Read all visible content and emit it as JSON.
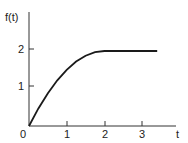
{
  "chart_data": {
    "type": "line",
    "title": "",
    "xlabel": "t",
    "ylabel": "f(t)",
    "x_ticks": [
      "0",
      "1",
      "2",
      "3"
    ],
    "y_ticks": [
      "1",
      "2"
    ],
    "xlim": [
      0,
      4
    ],
    "ylim": [
      0,
      2.5
    ],
    "grid": false,
    "legend": null,
    "series": [
      {
        "name": "f(t)",
        "description": "Rises as t(4-t)/2 from 0 to 2 on [0,2], then constant at 2",
        "x": [
          0,
          0.25,
          0.5,
          0.75,
          1.0,
          1.25,
          1.5,
          1.75,
          2.0,
          2.5,
          3.0,
          3.4
        ],
        "y": [
          0,
          0.47,
          0.875,
          1.22,
          1.5,
          1.72,
          1.875,
          1.97,
          2.0,
          2.0,
          2.0,
          2.0
        ]
      }
    ]
  },
  "labels": {
    "ylabel": "f(t)",
    "xlabel": "t",
    "origin": "0",
    "x1": "1",
    "x2": "2",
    "x3": "3",
    "y1": "1",
    "y2": "2"
  },
  "colors": {
    "line": "#1a1a1a"
  }
}
